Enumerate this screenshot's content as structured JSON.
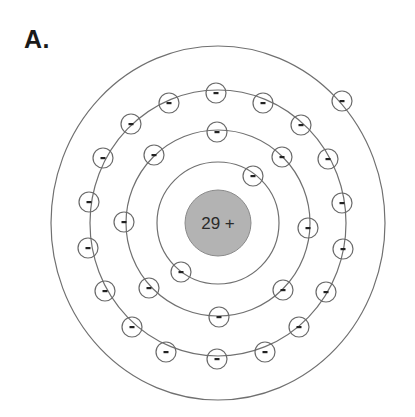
{
  "panel_label": "A.",
  "atom": {
    "nucleus": {
      "label": "29 +",
      "charge": 29,
      "cx": 218,
      "cy": 223,
      "r": 33,
      "fill": "#b3b3b3"
    },
    "center": {
      "cx": 218,
      "cy": 223
    },
    "shells": [
      {
        "name": "shell-1",
        "rx": 61,
        "ry": 61,
        "electron_count": 2,
        "electrons": [
          [
            253,
            176
          ],
          [
            181,
            272
          ]
        ]
      },
      {
        "name": "shell-2",
        "rx": 92,
        "ry": 93,
        "electron_count": 8,
        "electrons": [
          [
            217,
            132
          ],
          [
            154,
            155
          ],
          [
            282,
            157
          ],
          [
            124,
            222
          ],
          [
            308,
            228
          ],
          [
            149,
            288
          ],
          [
            283,
            290
          ],
          [
            219,
            317
          ]
        ]
      },
      {
        "name": "shell-3",
        "rx": 128,
        "ry": 133,
        "electron_count": 18,
        "electrons": [
          [
            216,
            93
          ],
          [
            169,
            103
          ],
          [
            263,
            103
          ],
          [
            131,
            124
          ],
          [
            301,
            125
          ],
          [
            103,
            158
          ],
          [
            328,
            159
          ],
          [
            89,
            202
          ],
          [
            342,
            203
          ],
          [
            88,
            248
          ],
          [
            343,
            249
          ],
          [
            105,
            291
          ],
          [
            326,
            292
          ],
          [
            132,
            327
          ],
          [
            299,
            327
          ],
          [
            166,
            352
          ],
          [
            265,
            352
          ],
          [
            217,
            359
          ]
        ]
      },
      {
        "name": "shell-4",
        "rx": 167,
        "ry": 177,
        "electron_count": 1,
        "electrons": [
          [
            342,
            101
          ]
        ]
      }
    ],
    "electron_radius": 10,
    "electron_symbol": "−"
  }
}
